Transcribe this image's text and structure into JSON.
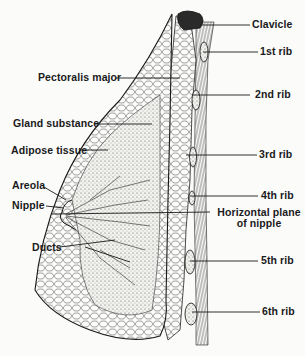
{
  "diagram": {
    "colors": {
      "ink": "#1a1a1a",
      "background": "#fbfbfa",
      "stipple": "#d8d8d4"
    },
    "labels": {
      "clavicle": "Clavicle",
      "rib1": "1st rib",
      "pectoralis": "Pectoralis major",
      "rib2": "2nd rib",
      "gland": "Gland substance",
      "adipose": "Adipose tissue",
      "rib3": "3rd rib",
      "areola": "Areola",
      "rib4": "4th rib",
      "nipple": "Nipple",
      "plane_line1": "Horizontal plane",
      "plane_line2": "of nipple",
      "ducts": "Ducts",
      "rib5": "5th rib",
      "rib6": "6th rib"
    }
  }
}
